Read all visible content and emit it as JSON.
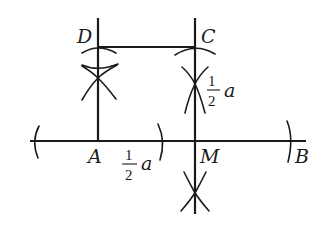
{
  "figure": {
    "points": {
      "A": {
        "label": "A"
      },
      "B": {
        "label": "B"
      },
      "C": {
        "label": "C"
      },
      "D": {
        "label": "D"
      },
      "M": {
        "label": "M"
      }
    },
    "labels": {
      "half_a_vertical": {
        "numerator": "1",
        "denominator": "2",
        "variable": "a"
      },
      "half_a_horizontal": {
        "numerator": "1",
        "denominator": "2",
        "variable": "a"
      }
    },
    "segments": [
      {
        "name": "AB",
        "from": "A-left-extension",
        "to": "B-right-extension"
      },
      {
        "name": "AD-perpendicular",
        "from": "A",
        "to": "D"
      },
      {
        "name": "MC-perpendicular",
        "from": "M",
        "to": "C"
      },
      {
        "name": "DC",
        "from": "D",
        "to": "C"
      }
    ]
  }
}
